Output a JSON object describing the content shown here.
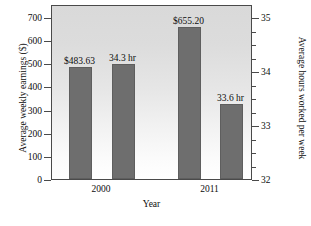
{
  "chart_data": {
    "type": "bar",
    "title": "",
    "xlabel": "Year",
    "ylabel": "Average weekly earnings ($)",
    "y2label": "Average hours worked per week",
    "categories": [
      "2000",
      "2011"
    ],
    "ylim": [
      0,
      700
    ],
    "y2lim": [
      32,
      35
    ],
    "grid": false,
    "legend": null,
    "y_ticks": [
      "0",
      "100",
      "200",
      "300",
      "400",
      "500",
      "600",
      "700"
    ],
    "y_tick_values": [
      0,
      100,
      200,
      300,
      400,
      500,
      600,
      700
    ],
    "y2_ticks": [
      "32",
      "33",
      "34",
      "35"
    ],
    "y2_tick_values": [
      32,
      33,
      34,
      35
    ],
    "y2_minor_tick_values": [
      32.25,
      32.5,
      32.75,
      33.25,
      33.5,
      33.75,
      34.25,
      34.5,
      34.75
    ],
    "series": [
      {
        "name": "Average weekly earnings ($)",
        "axis": "left",
        "values": [
          483.63,
          655.2
        ],
        "labels": [
          "$483.63",
          "$655.20"
        ]
      },
      {
        "name": "Average hours worked per week",
        "axis": "right",
        "values": [
          34.3,
          33.6
        ],
        "labels": [
          "34.3 hr",
          "33.6 hr"
        ]
      }
    ],
    "bars": [
      {
        "label": "$483.63",
        "value": 483.63,
        "axis": "left",
        "group": "2000",
        "x": 68,
        "width": 23,
        "top": 68,
        "bottom": 180
      },
      {
        "label": "34.3 hr",
        "value": 34.3,
        "axis": "right",
        "group": "2000",
        "x": 111,
        "width": 23,
        "top": 65,
        "bottom": 180
      },
      {
        "label": "$655.20",
        "value": 655.2,
        "axis": "left",
        "group": "2011",
        "x": 177,
        "width": 23,
        "top": 28,
        "bottom": 180
      },
      {
        "label": "33.6 hr",
        "value": 33.6,
        "axis": "right",
        "group": "2011",
        "x": 219,
        "width": 23,
        "top": 105,
        "bottom": 180
      }
    ],
    "colors": {
      "bar": "#6e6e6e",
      "axis": "#4a4a4a",
      "text": "#0d0d0d",
      "plot_background_top": "#d9d9d9",
      "plot_background_bottom": "#ffffff"
    }
  }
}
